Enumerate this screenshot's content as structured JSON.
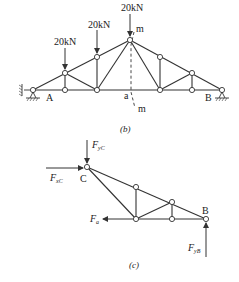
{
  "diagram_b": {
    "caption": "(b)",
    "loads": [
      {
        "label": "20kN",
        "x": 65,
        "y": 73
      },
      {
        "label": "20kN",
        "x": 97,
        "y": 57
      },
      {
        "label": "20kN",
        "x": 130,
        "y": 40
      }
    ],
    "labels": {
      "A": "A",
      "B": "B",
      "a": "a",
      "m_top": "m",
      "m_bottom": "m"
    }
  },
  "diagram_c": {
    "caption": "(c)",
    "labels": {
      "C": "C",
      "B": "B",
      "FyC": "F",
      "FyC_sub": "yC",
      "FxC": "F",
      "FxC_sub": "xC",
      "Fa": "F",
      "Fa_sub": "a",
      "FyB": "F",
      "FyB_sub": "yB"
    }
  }
}
